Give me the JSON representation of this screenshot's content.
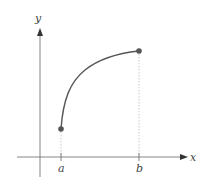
{
  "diagram": {
    "axes": {
      "x_label": "x",
      "y_label": "y"
    },
    "ticks": [
      {
        "label": "a"
      },
      {
        "label": "b"
      }
    ],
    "curve": {
      "description": "increasing concave-down curve from (a, f(a)) to (b, f(b))"
    },
    "colors": {
      "axis": "#555555",
      "curve": "#555555",
      "point": "#555555",
      "guide": "#bbbbbb"
    }
  }
}
